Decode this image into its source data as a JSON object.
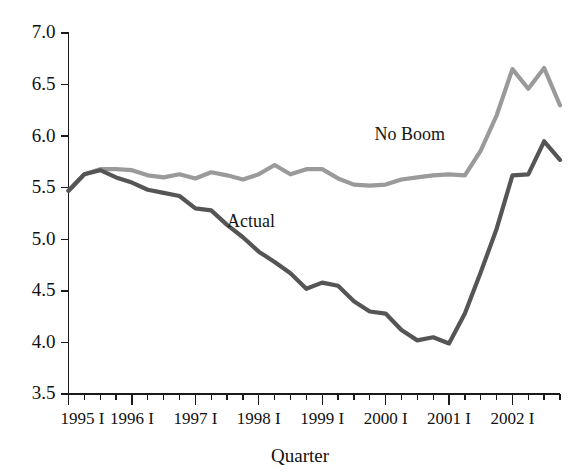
{
  "chart_data": {
    "type": "line",
    "title": "",
    "subtitle": "",
    "xlabel": "Quarter",
    "ylabel": "",
    "grid": false,
    "legend_position": "inline-annotation",
    "ylim": [
      3.5,
      7.0
    ],
    "ytick_labels": [
      "3.5",
      "4.0",
      "4.5",
      "5.0",
      "5.5",
      "6.0",
      "6.5",
      "7.0"
    ],
    "ytick_values": [
      3.5,
      4.0,
      4.5,
      5.0,
      5.5,
      6.0,
      6.5,
      7.0
    ],
    "xtick_labels": [
      "1995 I",
      "1996 I",
      "1997 I",
      "1998 I",
      "1999 I",
      "2000 I",
      "2001 I",
      "2002 I"
    ],
    "x_major_values": [
      0,
      4,
      8,
      12,
      16,
      20,
      24,
      28
    ],
    "x_minor_per_major": 3,
    "xlim": [
      0,
      31
    ],
    "x": [
      "1995 I",
      "1995 II",
      "1995 III",
      "1995 IV",
      "1996 I",
      "1996 II",
      "1996 III",
      "1996 IV",
      "1997 I",
      "1997 II",
      "1997 III",
      "1997 IV",
      "1998 I",
      "1998 II",
      "1998 III",
      "1998 IV",
      "1999 I",
      "1999 II",
      "1999 III",
      "1999 IV",
      "2000 I",
      "2000 II",
      "2000 III",
      "2000 IV",
      "2001 I",
      "2001 II",
      "2001 III",
      "2001 IV",
      "2002 I",
      "2002 II",
      "2002 III",
      "2002 IV"
    ],
    "series": [
      {
        "name": "No Boom",
        "color": "#9a9a9a",
        "label_x_index": 19.3,
        "label_y_value": 5.96,
        "values": [
          5.47,
          5.63,
          5.68,
          5.68,
          5.67,
          5.62,
          5.6,
          5.63,
          5.59,
          5.65,
          5.62,
          5.58,
          5.63,
          5.72,
          5.63,
          5.68,
          5.68,
          5.59,
          5.53,
          5.52,
          5.53,
          5.58,
          5.6,
          5.62,
          5.63,
          5.62,
          5.86,
          6.2,
          6.65,
          6.46,
          6.66,
          6.3
        ]
      },
      {
        "name": "Actual",
        "color": "#555555",
        "label_x_index": 10.0,
        "label_y_value": 5.12,
        "values": [
          5.47,
          5.63,
          5.67,
          5.6,
          5.55,
          5.48,
          5.45,
          5.42,
          5.3,
          5.28,
          5.14,
          5.02,
          4.88,
          4.78,
          4.67,
          4.52,
          4.58,
          4.55,
          4.4,
          4.3,
          4.28,
          4.12,
          4.02,
          4.05,
          3.99,
          4.28,
          4.68,
          5.1,
          5.62,
          5.63,
          5.95,
          5.77
        ]
      }
    ]
  }
}
